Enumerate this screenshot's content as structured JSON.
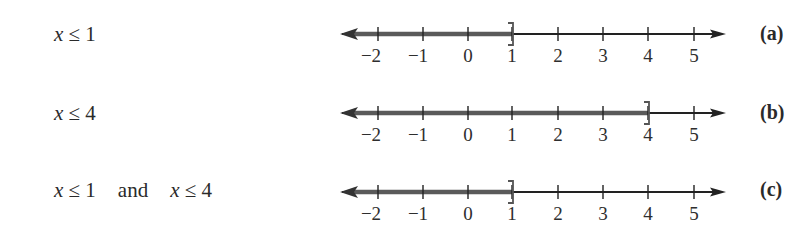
{
  "rows": [
    {
      "id": "a",
      "expression": [
        {
          "var": "x"
        },
        {
          "text": " ≤ 1"
        }
      ],
      "label": "(a)",
      "shaded_to": 1,
      "endpoint": "]",
      "endpoint_value": 1
    },
    {
      "id": "b",
      "expression": [
        {
          "var": "x"
        },
        {
          "text": " ≤ 4"
        }
      ],
      "label": "(b)",
      "shaded_to": 4,
      "endpoint": "]",
      "endpoint_value": 4
    },
    {
      "id": "c",
      "expression_parts": {
        "left_var": "x",
        "left_rel": " ≤ 1",
        "conj": "and",
        "right_var": "x",
        "right_rel": " ≤ 4"
      },
      "label": "(c)",
      "shaded_to": 1,
      "endpoint": "]",
      "endpoint_value": 1
    }
  ],
  "axis": {
    "ticks": [
      -2,
      -1,
      0,
      1,
      2,
      3,
      4,
      5
    ],
    "tick_labels": [
      "−2",
      "−1",
      "0",
      "1",
      "2",
      "3",
      "4",
      "5"
    ]
  },
  "colors": {
    "shade": "#5a5a5a",
    "line": "#222222",
    "text": "#2a2a2a"
  },
  "text": {
    "a_var": "x",
    "a_rel": " ≤ 1",
    "a_label": "(a)",
    "b_var": "x",
    "b_rel": " ≤ 4",
    "b_label": "(b)",
    "c_var1": "x",
    "c_rel1": " ≤ 1",
    "c_and": "and",
    "c_var2": "x",
    "c_rel2": " ≤ 4",
    "c_label": "(c)",
    "t0": "−2",
    "t1": "−1",
    "t2": "0",
    "t3": "1",
    "t4": "2",
    "t5": "3",
    "t6": "4",
    "t7": "5"
  }
}
